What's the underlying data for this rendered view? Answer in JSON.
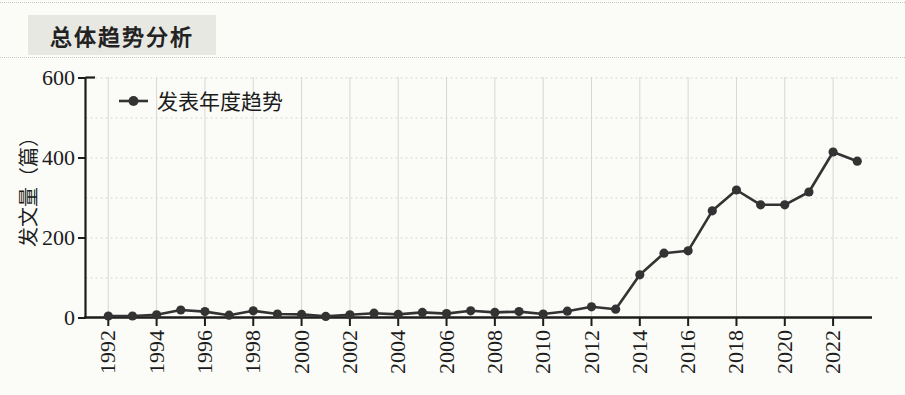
{
  "page": {
    "title": "总体趋势分析"
  },
  "chart_data": {
    "type": "line",
    "title": "",
    "xlabel": "",
    "ylabel": "发文量（篇）",
    "ylim": [
      0,
      600
    ],
    "yticks": [
      0,
      200,
      400,
      600
    ],
    "xticks": [
      1992,
      1994,
      1996,
      1998,
      2000,
      2002,
      2004,
      2006,
      2008,
      2010,
      2012,
      2014,
      2016,
      2018,
      2020,
      2022
    ],
    "x": [
      1992,
      1993,
      1994,
      1995,
      1996,
      1997,
      1998,
      1999,
      2000,
      2001,
      2002,
      2003,
      2004,
      2005,
      2006,
      2007,
      2008,
      2009,
      2010,
      2011,
      2012,
      2013,
      2014,
      2015,
      2016,
      2017,
      2018,
      2019,
      2020,
      2021,
      2022,
      2023
    ],
    "series": [
      {
        "name": "发表年度趋势",
        "values": [
          5,
          5,
          8,
          20,
          16,
          7,
          18,
          10,
          9,
          4,
          8,
          12,
          9,
          14,
          11,
          18,
          14,
          16,
          10,
          17,
          28,
          22,
          108,
          162,
          168,
          268,
          320,
          283,
          283,
          315,
          415,
          392
        ]
      }
    ],
    "grid": true,
    "legend_position": "top-left",
    "colors": {
      "line": "#333333",
      "marker": "#333333",
      "axis": "#1c1c1c",
      "text": "#1c1c1c",
      "grid_vertical": "#d8d8d2",
      "grid_horizontal_dashed": "#d6d6d0",
      "title_bg": "#e8e8e3",
      "page_bg": "#fbfbf8"
    }
  }
}
